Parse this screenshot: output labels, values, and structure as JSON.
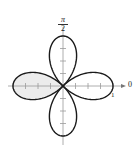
{
  "chart_data": {
    "type": "polar-line",
    "equation": "r = cos(2θ)",
    "title": "",
    "curve": {
      "kind": "rose",
      "petals": 4,
      "amplitude": 1,
      "petal_directions_deg": [
        0,
        90,
        180,
        270
      ],
      "shaded_petal_direction_deg": 180
    },
    "radial_ticks": [
      0.25,
      0.5,
      0.75,
      1
    ],
    "radial_range": [
      0,
      1
    ],
    "angle_labels": [
      {
        "angle": "0",
        "position": "right"
      },
      {
        "angle": "π/2",
        "position": "top"
      }
    ],
    "radial_tick_label": "1",
    "grid": false
  },
  "labels": {
    "pi_numerator": "π",
    "pi_denominator": "2",
    "zero": "0",
    "one": "1"
  },
  "colors": {
    "curve": "#1a1a1a",
    "axis": "#9a9a9a",
    "shade": "#ececec",
    "background": "#ffffff"
  }
}
